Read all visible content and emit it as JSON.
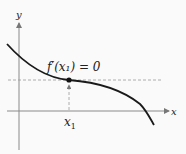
{
  "diagram": {
    "axes": {
      "x_label": "x",
      "y_label": "y"
    },
    "annotation": {
      "text": "f′(x₁) = 0"
    },
    "point_label": {
      "main": "x",
      "subscript": "1"
    },
    "colors": {
      "curve": "#1a1a1a",
      "axis": "#888888",
      "dashed": "#999999",
      "text": "#222222"
    }
  }
}
